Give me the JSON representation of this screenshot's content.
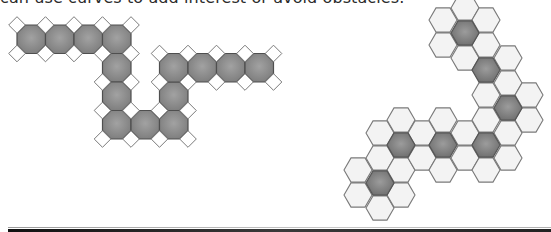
{
  "caption": "can use curves to add interest or avoid obstacles.",
  "colors": {
    "octagon_fill_center": "#a2a2a2",
    "octagon_fill_edge": "#7c7c7c",
    "octagon_stroke": "#4f4f4f",
    "diamond_fill": "#ffffff",
    "diamond_stroke": "#7a7a7a",
    "hex_light_fill": "#f3f3f3",
    "hex_dark_center": "#9c9c9c",
    "hex_dark_edge": "#6e6e6e",
    "hex_stroke": "#7a7a7a"
  },
  "octagon_path": {
    "pitch": 28.5,
    "origin": [
      17,
      25
    ],
    "cells": [
      [
        0,
        0
      ],
      [
        1,
        0
      ],
      [
        2,
        0
      ],
      [
        3,
        0
      ],
      [
        3,
        1
      ],
      [
        3,
        2
      ],
      [
        3,
        3
      ],
      [
        4,
        3
      ],
      [
        5,
        3
      ],
      [
        5,
        2
      ],
      [
        5,
        1
      ],
      [
        6,
        1
      ],
      [
        7,
        1
      ],
      [
        8,
        1
      ]
    ]
  },
  "hex_path": {
    "radius": 14,
    "columns": [
      {
        "x": 358,
        "cells": [
          {
            "y": 170,
            "dark": false
          },
          {
            "y": 195,
            "dark": false
          }
        ]
      },
      {
        "x": 380,
        "cells": [
          {
            "y": 133,
            "dark": false
          },
          {
            "y": 158,
            "dark": false
          },
          {
            "y": 183,
            "dark": true
          },
          {
            "y": 208,
            "dark": false
          }
        ]
      },
      {
        "x": 401,
        "cells": [
          {
            "y": 120,
            "dark": false
          },
          {
            "y": 145,
            "dark": true
          },
          {
            "y": 170,
            "dark": false
          },
          {
            "y": 195,
            "dark": false
          }
        ]
      },
      {
        "x": 422,
        "cells": [
          {
            "y": 133,
            "dark": false
          },
          {
            "y": 158,
            "dark": false
          }
        ]
      },
      {
        "x": 443,
        "cells": [
          {
            "y": 20,
            "dark": false
          },
          {
            "y": 45,
            "dark": false
          },
          {
            "y": 120,
            "dark": false
          },
          {
            "y": 145,
            "dark": true
          },
          {
            "y": 170,
            "dark": false
          }
        ]
      },
      {
        "x": 465,
        "cells": [
          {
            "y": 8,
            "dark": false
          },
          {
            "y": 33,
            "dark": true
          },
          {
            "y": 58,
            "dark": false
          },
          {
            "y": 133,
            "dark": false
          },
          {
            "y": 158,
            "dark": false
          }
        ]
      },
      {
        "x": 486,
        "cells": [
          {
            "y": 20,
            "dark": false
          },
          {
            "y": 45,
            "dark": false
          },
          {
            "y": 70,
            "dark": true
          },
          {
            "y": 95,
            "dark": false
          },
          {
            "y": 120,
            "dark": false
          },
          {
            "y": 145,
            "dark": true
          },
          {
            "y": 170,
            "dark": false
          }
        ]
      },
      {
        "x": 508,
        "cells": [
          {
            "y": 58,
            "dark": false
          },
          {
            "y": 83,
            "dark": false
          },
          {
            "y": 108,
            "dark": true
          },
          {
            "y": 133,
            "dark": false
          },
          {
            "y": 158,
            "dark": false
          }
        ]
      },
      {
        "x": 529,
        "cells": [
          {
            "y": 95,
            "dark": false
          },
          {
            "y": 120,
            "dark": false
          }
        ]
      }
    ]
  }
}
